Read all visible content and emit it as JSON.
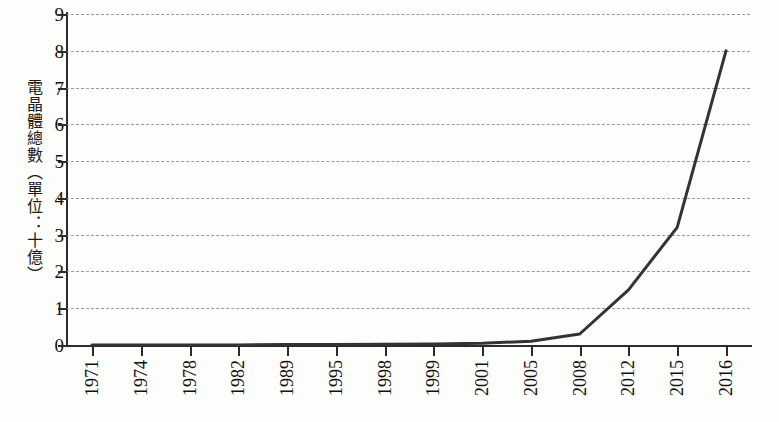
{
  "chart_data": {
    "type": "line",
    "title": "",
    "subtitle": "",
    "xlabel": "",
    "ylabel": "電晶體總數（單位：十億）",
    "categories": [
      "1971",
      "1974",
      "1978",
      "1982",
      "1989",
      "1995",
      "1998",
      "1999",
      "2001",
      "2005",
      "2008",
      "2012",
      "2015",
      "2016"
    ],
    "series": [
      {
        "name": "電晶體總數",
        "values": [
          0.0,
          0.0,
          0.0,
          0.0,
          0.01,
          0.01,
          0.02,
          0.03,
          0.05,
          0.1,
          0.3,
          1.5,
          3.2,
          8.0
        ]
      }
    ],
    "ylim": [
      0,
      9
    ],
    "y_ticks": [
      "0",
      "1",
      "2",
      "3",
      "4",
      "5",
      "6",
      "7",
      "8",
      "9"
    ],
    "grid": true,
    "legend": "none",
    "line_color": "#333333",
    "grid_color": "#9a9a9a",
    "axis_color": "#2b2b2b",
    "background_color": "#fdfdfb"
  }
}
